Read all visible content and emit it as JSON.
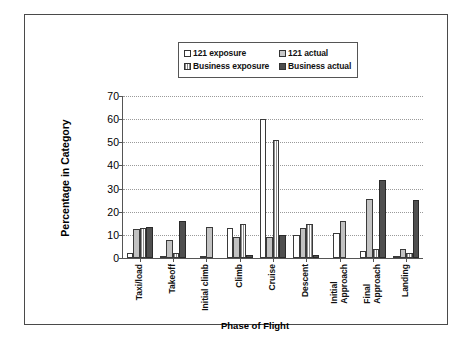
{
  "chart_data": {
    "type": "bar",
    "title": "",
    "xlabel": "Phase of Flight",
    "ylabel": "Percentage in Category",
    "ylim": [
      0,
      70
    ],
    "yticks": [
      0,
      10,
      20,
      30,
      40,
      50,
      60,
      70
    ],
    "grid": true,
    "legend_position": "top-center",
    "categories": [
      "Taxi/load",
      "Takeoff",
      "Initial climb",
      "Climb",
      "Cruise",
      "Descent",
      "Initial Approach",
      "Final Approach",
      "Landing"
    ],
    "category_lines": [
      [
        "Taxi/load"
      ],
      [
        "Takeoff"
      ],
      [
        "Initial climb"
      ],
      [
        "Climb"
      ],
      [
        "Cruise"
      ],
      [
        "Descent"
      ],
      [
        "Initial",
        "Approach"
      ],
      [
        "Final",
        "Approach"
      ],
      [
        "Landing"
      ]
    ],
    "series": [
      {
        "name": "121 exposure",
        "style": "white",
        "values": [
          2,
          1,
          1,
          13,
          60,
          10,
          11,
          3,
          1
        ]
      },
      {
        "name": "121 actual",
        "style": "gray",
        "values": [
          12.5,
          8,
          13.5,
          9,
          9,
          13,
          16,
          25.5,
          4
        ]
      },
      {
        "name": "Business exposure",
        "style": "dotted",
        "values": [
          13,
          2,
          0,
          14.5,
          51,
          14.5,
          0,
          4,
          2
        ]
      },
      {
        "name": "Business actual",
        "style": "dark",
        "values": [
          13.5,
          16,
          0,
          1.5,
          10,
          1.5,
          0,
          33.5,
          25
        ]
      }
    ]
  },
  "legend": {
    "entries": [
      {
        "label": "121 exposure",
        "swatch": "white-swatch-icon"
      },
      {
        "label": "121 actual",
        "swatch": "gray-swatch-icon"
      },
      {
        "label": "Business exposure",
        "swatch": "dotted-swatch-icon"
      },
      {
        "label": "Business actual",
        "swatch": "dark-swatch-icon"
      }
    ]
  }
}
